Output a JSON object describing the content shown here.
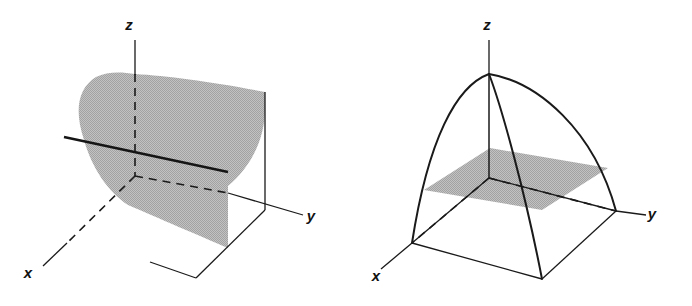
{
  "page": {
    "background_color": "#ffffff",
    "width": 692,
    "height": 306
  },
  "style": {
    "ink_color": "#1a1a1a",
    "surface_fill": "#b4b4b4",
    "thin_stroke_width": 1.3,
    "thick_stroke_width": 2.4,
    "curve_stroke_width": 2.0,
    "dash_pattern": "7 5"
  },
  "figures": [
    {
      "id": "left",
      "name": "parabolic-cylinder",
      "type": "surface-plot-3d",
      "description": "Shaded parabolic cylinder rising over the xy-plane, cut by a horizontal trace line.",
      "axes": [
        {
          "name": "x",
          "label": "x",
          "label_x": 28,
          "label_y": 278,
          "hidden_segment": true
        },
        {
          "name": "y",
          "label": "y",
          "label_x": 311,
          "label_y": 221,
          "hidden_segment": false
        },
        {
          "name": "z",
          "label": "z",
          "label_x": 129,
          "label_y": 30,
          "hidden_segment": true
        }
      ],
      "elements": [
        "shaded-surface",
        "z-axis-dashed-behind-surface",
        "x-axis-dashed-behind-surface",
        "horizontal-trace-line",
        "right-vertical-edge",
        "front-bottom-edges"
      ]
    },
    {
      "id": "right",
      "name": "elliptic-paraboloid-cone",
      "type": "surface-plot-3d",
      "description": "Dome-like surface over a square base with a shaded horizontal cross-section plane.",
      "axes": [
        {
          "name": "x",
          "label": "x",
          "label_x": 30,
          "label_y": 280,
          "hidden_segment": true
        },
        {
          "name": "y",
          "label": "y",
          "label_x": 306,
          "label_y": 219,
          "hidden_segment": false
        },
        {
          "name": "z",
          "label": "z",
          "label_x": 141,
          "label_y": 30,
          "hidden_segment": true
        }
      ],
      "elements": [
        "apex-point",
        "four-meridian-curves",
        "square-base-outline",
        "shaded-cross-section-plane",
        "x-axis-dashed-behind-plane",
        "y-axis-dashed-behind-plane"
      ]
    }
  ]
}
